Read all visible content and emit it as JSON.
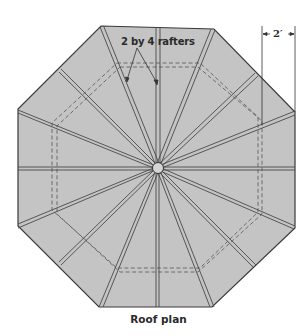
{
  "diagram": {
    "title": "Roof plan",
    "shape": "octagon",
    "rafter_count": 16,
    "annotations": {
      "rafter_label": "2 by 4 rafters",
      "overhang_dimension": "2′"
    },
    "colors": {
      "roof_fill": "#c4c4c4",
      "outline": "#3a3a3a",
      "rafter": "#4a4a4a",
      "dashed_wall": "#555555",
      "background": "#ffffff"
    }
  }
}
